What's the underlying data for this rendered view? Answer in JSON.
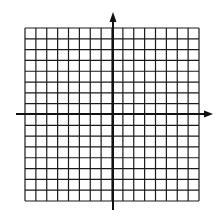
{
  "diagram": {
    "type": "coordinate-plane-grid",
    "grid": {
      "columns": 16,
      "rows": 16,
      "left": 25,
      "top": 28,
      "right": 199,
      "bottom": 201,
      "line_color": "#1a1a1a"
    },
    "axes": {
      "x_axis": {
        "y": 114,
        "x_start": 16,
        "x_end": 213,
        "arrow": "right"
      },
      "y_axis": {
        "x": 113,
        "y_start": 210,
        "y_end": 12,
        "arrow": "up"
      },
      "color": "#111111"
    }
  }
}
